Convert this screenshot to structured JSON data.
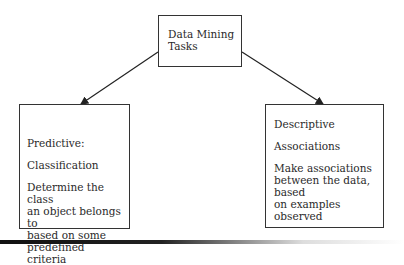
{
  "diagram": {
    "root": {
      "lines": [
        "Data Mining",
        "Tasks"
      ]
    },
    "children": [
      {
        "id": "predictive",
        "title": "Predictive:",
        "task": "Classification",
        "description": [
          "Determine the class",
          "an object belongs to",
          "based on some",
          "predefined criteria"
        ]
      },
      {
        "id": "descriptive",
        "title": "Descriptive",
        "task": "Associations",
        "description": [
          "Make associations",
          "between the data, based",
          "on examples observed"
        ]
      }
    ],
    "edges": [
      {
        "from": "root",
        "to": "predictive"
      },
      {
        "from": "root",
        "to": "descriptive"
      }
    ]
  }
}
